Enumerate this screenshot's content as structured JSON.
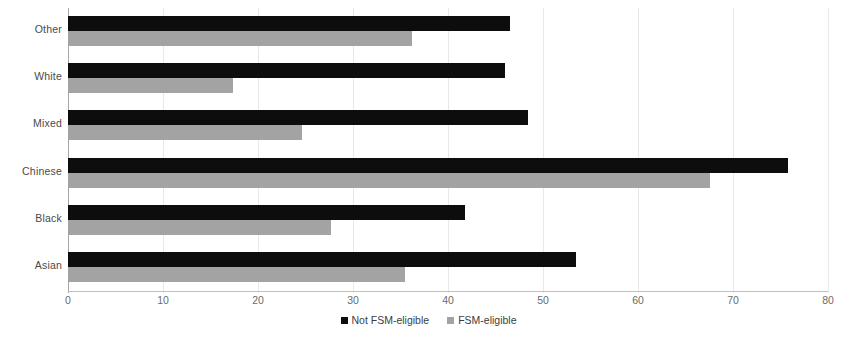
{
  "chart_data": {
    "type": "bar",
    "orientation": "horizontal",
    "title": "",
    "subtitle": "",
    "xlabel": "",
    "ylabel": "",
    "xlim": [
      0,
      80
    ],
    "xticks": [
      0,
      10,
      20,
      30,
      40,
      50,
      60,
      70,
      80
    ],
    "xtick_labels": [
      "0",
      "10",
      "20",
      "30",
      "40",
      "50",
      "60",
      "70",
      "80"
    ],
    "grid": true,
    "grid_axis": "x",
    "legend_position": "bottom-center",
    "categories": [
      "Asian",
      "Black",
      "Chinese",
      "Mixed",
      "White",
      "Other"
    ],
    "category_order_top_to_bottom": [
      "Other",
      "White",
      "Mixed",
      "Chinese",
      "Black",
      "Asian"
    ],
    "series": [
      {
        "name": "Not FSM-eligible",
        "color": "#0d0d0d",
        "values": [
          53.5,
          41.8,
          75.8,
          48.4,
          46.0,
          46.5
        ]
      },
      {
        "name": "FSM-eligible",
        "color": "#a3a3a3",
        "values": [
          35.5,
          27.7,
          67.6,
          24.6,
          17.4,
          36.2
        ]
      }
    ]
  },
  "legend": {
    "items": [
      {
        "label": "Not FSM-eligible",
        "color": "#0d0d0d",
        "swatch_name": "legend-swatch-not-fsm-eligible"
      },
      {
        "label": "FSM-eligible",
        "color": "#a3a3a3",
        "swatch_name": "legend-swatch-fsm-eligible"
      }
    ]
  },
  "colors": {
    "series_primary": "#0d0d0d",
    "series_secondary": "#a3a3a3",
    "gridline": "#e8e8e8",
    "axis": "#bfbfbf",
    "label_text": "#4a4a4a",
    "tick_text": "#6b6b6b",
    "background": "#ffffff"
  }
}
